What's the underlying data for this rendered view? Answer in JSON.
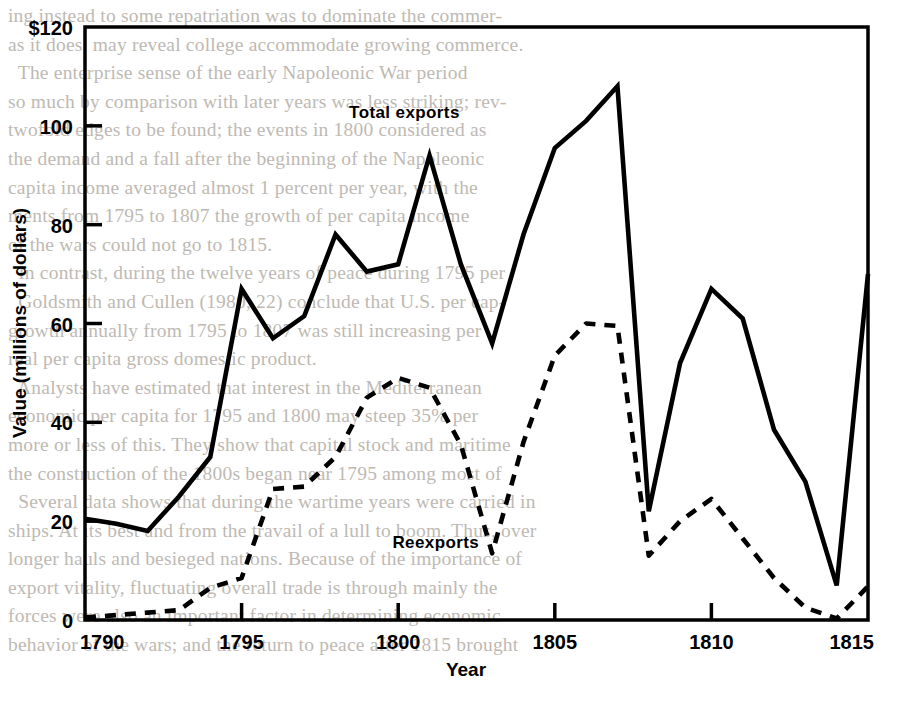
{
  "background_text": {
    "lines": [
      "ing instead to some repatriation was to dominate the commer-",
      "as it does, may reveal college accommodate growing commerce.",
      "  The enterprise sense of the early Napoleonic War period",
      "so much by comparison with later years was less striking; rev-",
      "twofold edges to be found; the events in 1800 considered as",
      "the demand and a fall after the beginning of the Napoleonic",
      "capita income averaged almost 1 percent per year, with the",
      "ments from 1795 to 1807 the growth of per capita income",
      "of the wars could not go to 1815.",
      "  In contrast, during the twelve years of peace during 1795 per",
      "  Goldsmith and Cullen (1980, 22) conclude that U.S. per cap-",
      "growth annually from 1795 to 1807 was still increasing per",
      "real per capita gross domestic product.",
      "  Analysts have estimated that interest in the Mediterranean",
      "economic per capita for 1795 and 1800 may steep 35% per",
      "more or less of this. They show that capital stock and maritime",
      "the construction of the 1800s began near 1795 among most of",
      "  Several data shows that during the wartime years were carried in",
      "ships. At its best and from the travail of a lull to boom. Thus, over",
      "longer hauls and besieged nations. Because of the importance of",
      "export vitality, fluctuating overall trade is through mainly the",
      "forces were also an important factor in determining economic",
      "behavior of the wars; and the return to peace after 1815 brought"
    ]
  },
  "chart_data": {
    "type": "line",
    "title": "",
    "xlabel": "Year",
    "ylabel": "Value (millions of dollars)",
    "xlim": [
      1790,
      1815
    ],
    "ylim": [
      0,
      120
    ],
    "yticks": [
      0,
      20,
      40,
      60,
      80,
      100,
      120
    ],
    "ytick_labels": [
      "0",
      "20",
      "40",
      "60",
      "80",
      "100",
      "$120"
    ],
    "xticks": [
      1790,
      1795,
      1800,
      1805,
      1810,
      1815
    ],
    "xtick_labels": [
      "1790",
      "1795",
      "1800",
      "1805",
      "1810",
      "1815"
    ],
    "grid": false,
    "legend_position": "inline-annotation",
    "x": [
      1790,
      1791,
      1792,
      1793,
      1794,
      1795,
      1796,
      1797,
      1798,
      1799,
      1800,
      1801,
      1802,
      1803,
      1804,
      1805,
      1806,
      1807,
      1808,
      1809,
      1810,
      1811,
      1812,
      1813,
      1814,
      1815
    ],
    "series": [
      {
        "name": "Total exports",
        "style": "solid",
        "color": "#000000",
        "values": [
          20.5,
          19.5,
          18.0,
          25.0,
          33.0,
          67.0,
          57.0,
          61.5,
          78.0,
          70.5,
          72.0,
          94.0,
          72.0,
          56.0,
          78.0,
          95.5,
          101.0,
          108.0,
          22.0,
          52.0,
          67.0,
          61.0,
          38.5,
          28.0,
          7.0,
          70.0
        ]
      },
      {
        "name": "Reexports",
        "style": "dashed",
        "color": "#000000",
        "values": [
          0.5,
          1.0,
          1.5,
          2.0,
          6.5,
          8.5,
          26.5,
          27.0,
          33.0,
          45.0,
          49.0,
          47.0,
          35.5,
          13.5,
          36.0,
          53.5,
          60.0,
          59.5,
          13.0,
          20.0,
          24.5,
          16.5,
          8.5,
          2.5,
          0.3,
          6.8
        ]
      }
    ],
    "annotations": [
      {
        "text": "Total exports",
        "x": 1800.2,
        "y": 101.5
      },
      {
        "text": "Reexports",
        "x": 1801.2,
        "y": 14.5
      }
    ]
  }
}
